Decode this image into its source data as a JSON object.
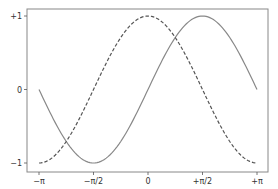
{
  "chart_data": {
    "type": "line",
    "title": "",
    "xlabel": "",
    "ylabel": "",
    "xlim": [
      -3.14159,
      3.14159
    ],
    "ylim": [
      -1.0,
      1.0
    ],
    "grid": false,
    "legend": null,
    "x_ticks": [
      {
        "value": -3.14159,
        "label": "−π"
      },
      {
        "value": -1.5708,
        "label": "−π/2"
      },
      {
        "value": 0,
        "label": "0"
      },
      {
        "value": 1.5708,
        "label": "+π/2"
      },
      {
        "value": 3.14159,
        "label": "+π"
      }
    ],
    "y_ticks": [
      {
        "value": 1,
        "label": "+1"
      },
      {
        "value": 0,
        "label": "0"
      },
      {
        "value": -1,
        "label": "−1"
      }
    ],
    "series": [
      {
        "name": "sin(x)",
        "style": "solid",
        "color": "#888888",
        "x": [
          -3.14159,
          -2.35619,
          -1.5708,
          -0.7854,
          0,
          0.7854,
          1.5708,
          2.35619,
          3.14159
        ],
        "values": [
          0,
          -0.707,
          -1,
          -0.707,
          0,
          0.707,
          1,
          0.707,
          0
        ]
      },
      {
        "name": "cos(x)",
        "style": "dashed",
        "color": "#555555",
        "x": [
          -3.14159,
          -2.35619,
          -1.5708,
          -0.7854,
          0,
          0.7854,
          1.5708,
          2.35619,
          3.14159
        ],
        "values": [
          -1,
          -0.707,
          0,
          0.707,
          1,
          0.707,
          0,
          -0.707,
          -1
        ]
      }
    ]
  },
  "axes": {
    "frame_color": "#888888"
  }
}
